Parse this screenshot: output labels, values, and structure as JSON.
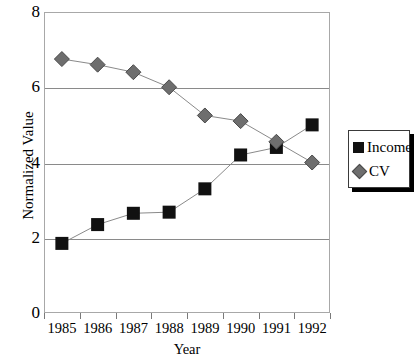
{
  "chart_data": {
    "type": "line",
    "title": "",
    "xlabel": "Year",
    "ylabel": "Normalized Value",
    "categories": [
      "1985",
      "1986",
      "1987",
      "1988",
      "1989",
      "1990",
      "1991",
      "1992"
    ],
    "x": [
      1985,
      1986,
      1987,
      1988,
      1989,
      1990,
      1991,
      1992
    ],
    "series": [
      {
        "name": "Income",
        "marker": "square",
        "color": "#111111",
        "values": [
          1.85,
          2.35,
          2.65,
          2.68,
          3.3,
          4.2,
          4.4,
          5.0
        ]
      },
      {
        "name": "CV",
        "marker": "diamond",
        "color": "#6e6e6e",
        "values": [
          6.75,
          6.6,
          6.4,
          6.0,
          5.25,
          5.1,
          4.55,
          4.0
        ]
      }
    ],
    "ylim": [
      0,
      8
    ],
    "ytick_labels": [
      "0",
      "2",
      "4",
      "6",
      "8"
    ],
    "yticks": [
      0,
      2,
      4,
      6,
      8
    ],
    "gridlines": [
      2,
      4,
      6
    ],
    "grid": true,
    "legend_position": "right",
    "line_color": "#8a8a8a",
    "frame_color": "#a8a8a8"
  },
  "legend": {
    "entries": [
      {
        "label": "Income",
        "marker": "square"
      },
      {
        "label": "CV",
        "marker": "diamond"
      }
    ]
  }
}
